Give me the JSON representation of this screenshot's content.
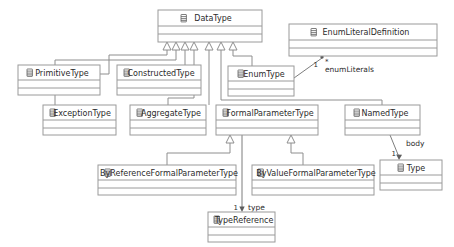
{
  "diagram": {
    "kind": "uml-class-diagram",
    "background_color": "#ffffff",
    "line_color": "#8e8e8e",
    "text_color": "#2b2b2b",
    "class_icon_name": "class-icon",
    "classes": [
      {
        "id": "datatype",
        "name": "DataType",
        "x": 158,
        "y": 10,
        "w": 104,
        "h": 32
      },
      {
        "id": "enumliteraldefinition",
        "name": "EnumLiteralDefinition",
        "x": 289,
        "y": 24,
        "w": 148,
        "h": 32
      },
      {
        "id": "primitivetype",
        "name": "PrimitiveType",
        "x": 18,
        "y": 65,
        "w": 82,
        "h": 30
      },
      {
        "id": "constructedtype",
        "name": "ConstructedType",
        "x": 117,
        "y": 65,
        "w": 84,
        "h": 30
      },
      {
        "id": "enumtype",
        "name": "EnumType",
        "x": 228,
        "y": 66,
        "w": 66,
        "h": 30
      },
      {
        "id": "exceptiontype",
        "name": "ExceptionType",
        "x": 43,
        "y": 105,
        "w": 73,
        "h": 30
      },
      {
        "id": "aggregatetype",
        "name": "AggregateType",
        "x": 130,
        "y": 105,
        "w": 76,
        "h": 30
      },
      {
        "id": "formalparametertype",
        "name": "FormalParameterType",
        "x": 216,
        "y": 105,
        "w": 102,
        "h": 30
      },
      {
        "id": "namedtype",
        "name": "NamedType",
        "x": 345,
        "y": 105,
        "w": 75,
        "h": 30
      },
      {
        "id": "byreferenceformalparametertype",
        "name": "ByReferenceFormalParameterType",
        "x": 98,
        "y": 165,
        "w": 138,
        "h": 30
      },
      {
        "id": "byvalueformalparametertype",
        "name": "ByValueFormalParameterType",
        "x": 252,
        "y": 165,
        "w": 122,
        "h": 30
      },
      {
        "id": "type",
        "name": "Type",
        "x": 380,
        "y": 160,
        "w": 62,
        "h": 30
      },
      {
        "id": "typereference",
        "name": "TypeReference",
        "x": 208,
        "y": 212,
        "w": 67,
        "h": 30
      }
    ],
    "generalizations": [
      {
        "id": "gen-primitivetype",
        "child": "PrimitiveType",
        "parent": "DataType"
      },
      {
        "id": "gen-constructedtype",
        "child": "ConstructedType",
        "parent": "DataType"
      },
      {
        "id": "gen-exceptiontype",
        "child": "ExceptionType",
        "parent": "DataType"
      },
      {
        "id": "gen-aggregatetype",
        "child": "AggregateType",
        "parent": "DataType"
      },
      {
        "id": "gen-formalparametertype",
        "child": "FormalParameterType",
        "parent": "DataType"
      },
      {
        "id": "gen-namedtype",
        "child": "NamedType",
        "parent": "DataType"
      },
      {
        "id": "gen-enumtype",
        "child": "EnumType",
        "parent": "DataType"
      },
      {
        "id": "gen-byreference",
        "child": "ByReferenceFormalParameterType",
        "parent": "FormalParameterType"
      },
      {
        "id": "gen-byvalue",
        "child": "ByValueFormalParameterType",
        "parent": "FormalParameterType"
      }
    ],
    "associations": [
      {
        "id": "assoc-enumliterals",
        "source": "EnumType",
        "target": "EnumLiteralDefinition",
        "role_label": "enumLiterals",
        "source_multiplicity": "1",
        "target_multiplicity": "*"
      },
      {
        "id": "assoc-body",
        "source": "NamedType",
        "target": "Type",
        "role_label": "body",
        "source_multiplicity": "",
        "target_multiplicity": "1"
      },
      {
        "id": "assoc-type",
        "source": "FormalParameterType",
        "target": "TypeReference",
        "role_label": "type",
        "source_multiplicity": "",
        "target_multiplicity": "1"
      }
    ]
  }
}
